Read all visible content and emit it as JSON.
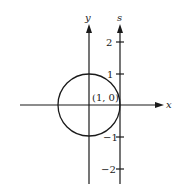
{
  "diagram": {
    "axes": {
      "x_label": "x",
      "y_label": "y",
      "s_label": "s"
    },
    "s_ticks": [
      {
        "value": 2,
        "label": "2"
      },
      {
        "value": 1,
        "label": "1"
      },
      {
        "value": -1,
        "label": "−1"
      },
      {
        "value": -2,
        "label": "−2"
      }
    ],
    "point_label": "(1, 0)",
    "circle": {
      "center": [
        0,
        0
      ],
      "radius": 1
    },
    "colors": {
      "stroke": "#1a1a1a",
      "background": "#ffffff"
    }
  }
}
